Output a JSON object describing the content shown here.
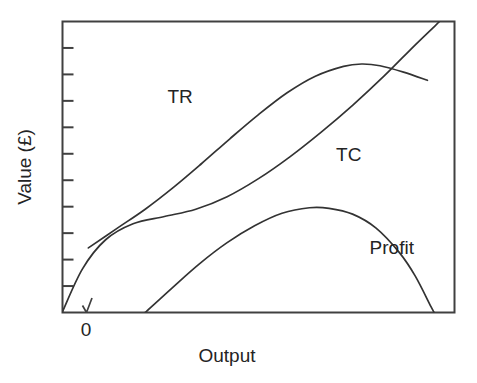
{
  "chart_data": {
    "type": "line",
    "title": "",
    "xlabel": "Output",
    "ylabel": "Value (£)",
    "origin_label": "0",
    "grid": false,
    "legend_position": "inline-curve-labels",
    "axis": {
      "x_tick_labels": [],
      "y_tick_labels": [],
      "y_tick_count": 10,
      "x_range_label": "Output",
      "y_range_label": "Value (£)"
    },
    "annotations": [
      {
        "text": "TR",
        "x": 0.3,
        "y": 0.72
      },
      {
        "text": "TC",
        "x": 0.73,
        "y": 0.52
      },
      {
        "text": "Profit",
        "x": 0.84,
        "y": 0.2
      }
    ],
    "series": [
      {
        "name": "TR",
        "label": "TR",
        "color": "#333333",
        "description": "Total revenue: concave curve rising from low output, peaking then declining",
        "points": [
          [
            0.066,
            0.222
          ],
          [
            0.14,
            0.29
          ],
          [
            0.211,
            0.355
          ],
          [
            0.283,
            0.43
          ],
          [
            0.355,
            0.512
          ],
          [
            0.427,
            0.597
          ],
          [
            0.5,
            0.68
          ],
          [
            0.573,
            0.755
          ],
          [
            0.645,
            0.812
          ],
          [
            0.717,
            0.846
          ],
          [
            0.763,
            0.854
          ],
          [
            0.81,
            0.848
          ],
          [
            0.87,
            0.826
          ],
          [
            0.931,
            0.798
          ]
        ]
      },
      {
        "name": "TC",
        "label": "TC",
        "color": "#333333",
        "description": "Total cost: S-shaped curve from the origin rising steeply at high output",
        "points": [
          [
            0.0,
            0.003
          ],
          [
            0.051,
            0.15
          ],
          [
            0.11,
            0.25
          ],
          [
            0.18,
            0.305
          ],
          [
            0.26,
            0.33
          ],
          [
            0.34,
            0.355
          ],
          [
            0.42,
            0.398
          ],
          [
            0.5,
            0.46
          ],
          [
            0.58,
            0.535
          ],
          [
            0.66,
            0.62
          ],
          [
            0.74,
            0.712
          ],
          [
            0.82,
            0.812
          ],
          [
            0.9,
            0.92
          ],
          [
            0.962,
            1.0
          ]
        ]
      },
      {
        "name": "Profit",
        "label": "Profit",
        "color": "#333333",
        "description": "Profit: inverted-U, zero at low output, peaking mid-range, zero again at high output",
        "points": [
          [
            0.211,
            0.0
          ],
          [
            0.28,
            0.085
          ],
          [
            0.35,
            0.168
          ],
          [
            0.42,
            0.24
          ],
          [
            0.49,
            0.298
          ],
          [
            0.56,
            0.341
          ],
          [
            0.63,
            0.36
          ],
          [
            0.68,
            0.358
          ],
          [
            0.74,
            0.338
          ],
          [
            0.8,
            0.29
          ],
          [
            0.86,
            0.205
          ],
          [
            0.9,
            0.125
          ],
          [
            0.94,
            0.02
          ],
          [
            0.948,
            0.0
          ]
        ]
      }
    ]
  }
}
